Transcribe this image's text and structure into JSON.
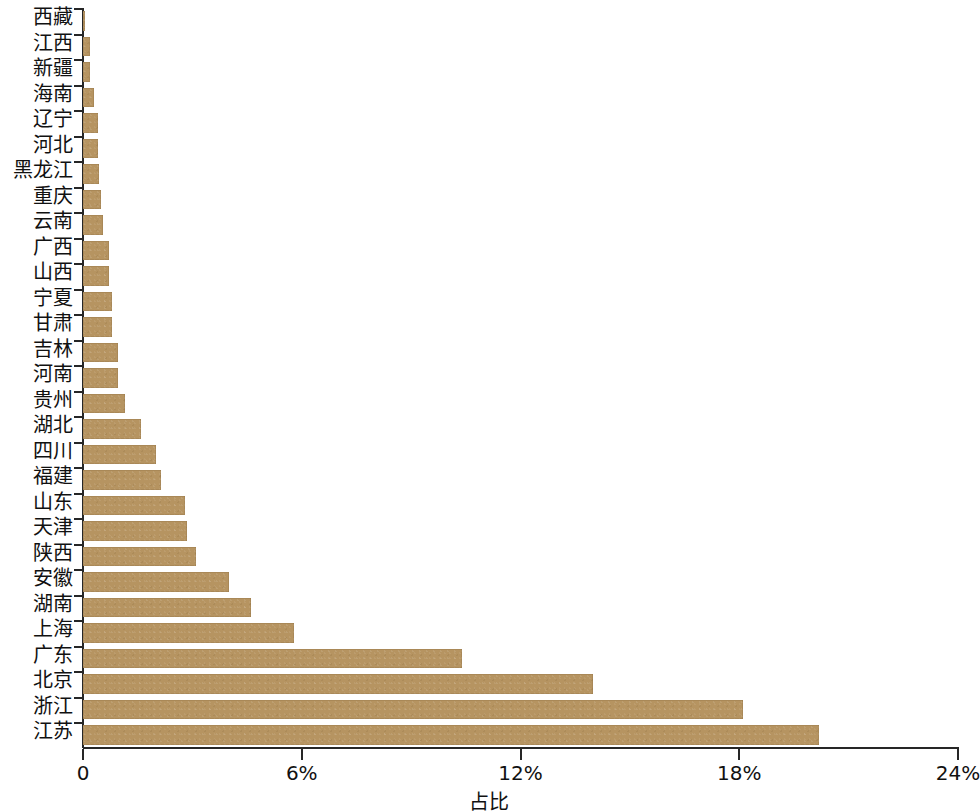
{
  "chart_data": {
    "type": "bar",
    "orientation": "horizontal",
    "title": "",
    "subtitle": "",
    "xlabel": "占比",
    "ylabel": "",
    "xlim": [
      0,
      24
    ],
    "x_unit": "%",
    "xticks": [
      0,
      6,
      12,
      18,
      24
    ],
    "xtick_labels": [
      "0",
      "6%",
      "12%",
      "18%",
      "24%"
    ],
    "grid": false,
    "legend": "none",
    "bar_color": "#b69461",
    "axis_color": "#262626",
    "background_color": "#ffffff",
    "categories": [
      "西藏",
      "江西",
      "新疆",
      "海南",
      "辽宁",
      "河北",
      "黑龙江",
      "重庆",
      "云南",
      "广西",
      "山西",
      "宁夏",
      "甘肃",
      "吉林",
      "河南",
      "贵州",
      "湖北",
      "四川",
      "福建",
      "山东",
      "天津",
      "陕西",
      "安徽",
      "湖南",
      "上海",
      "广东",
      "北京",
      "浙江",
      "江苏"
    ],
    "values": [
      0.05,
      0.2,
      0.2,
      0.3,
      0.4,
      0.4,
      0.45,
      0.5,
      0.55,
      0.7,
      0.7,
      0.8,
      0.8,
      0.95,
      0.95,
      1.15,
      1.6,
      2.0,
      2.15,
      2.8,
      2.85,
      3.1,
      4.0,
      4.6,
      5.8,
      10.4,
      14.0,
      18.1,
      20.2
    ]
  }
}
